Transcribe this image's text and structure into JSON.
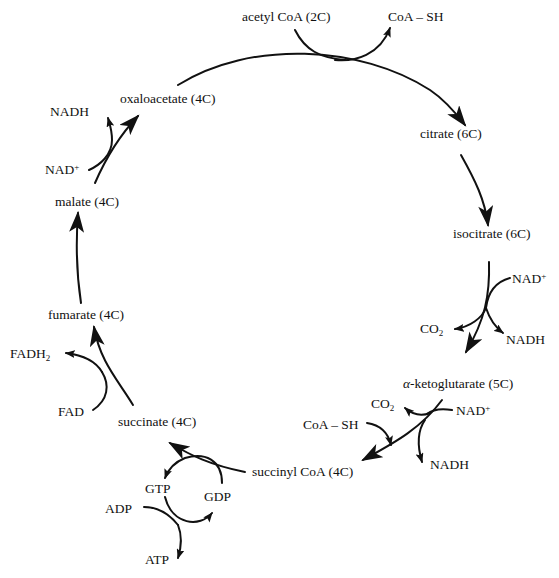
{
  "diagram": {
    "metabolites": [
      {
        "id": "acetyl_coa",
        "label": "acetyl CoA (2C)"
      },
      {
        "id": "citrate",
        "label": "citrate (6C)"
      },
      {
        "id": "isocitrate",
        "label": "isocitrate (6C)"
      },
      {
        "id": "alpha_kg_prefix",
        "label": "α"
      },
      {
        "id": "alpha_kg",
        "label": "-ketoglutarate (5C)"
      },
      {
        "id": "succinyl_coa",
        "label": "succinyl CoA (4C)"
      },
      {
        "id": "succinate",
        "label": "succinate (4C)"
      },
      {
        "id": "fumarate",
        "label": "fumarate (4C)"
      },
      {
        "id": "malate",
        "label": "malate (4C)"
      },
      {
        "id": "oxaloacetate",
        "label": "oxaloacetate (4C)"
      }
    ],
    "cofactors": {
      "coa_sh_top": "CoA – SH",
      "nad_isocitrate": "NAD",
      "nadh_isocitrate": "NADH",
      "co2_isocitrate": "CO",
      "co2_akg": "CO",
      "nad_akg": "NAD",
      "nadh_akg": "NADH",
      "coa_sh_akg": "CoA – SH",
      "gtp": "GTP",
      "gdp": "GDP",
      "adp": "ADP",
      "atp": "ATP",
      "fad": "FAD",
      "fadh2": "FADH",
      "nad_malate": "NAD",
      "nadh_malate": "NADH",
      "plus": "+",
      "sub2": "2"
    },
    "steps": [
      {
        "from": "oxaloacetate + acetyl CoA",
        "to": "citrate",
        "releases": "CoA – SH"
      },
      {
        "from": "citrate",
        "to": "isocitrate"
      },
      {
        "from": "isocitrate",
        "to": "α-ketoglutarate",
        "inputs": [
          "NAD+"
        ],
        "outputs": [
          "CO2",
          "NADH"
        ]
      },
      {
        "from": "α-ketoglutarate",
        "to": "succinyl CoA",
        "inputs": [
          "NAD+",
          "CoA – SH"
        ],
        "outputs": [
          "CO2",
          "NADH"
        ]
      },
      {
        "from": "succinyl CoA",
        "to": "succinate",
        "inputs": [
          "GDP"
        ],
        "outputs": [
          "GTP"
        ],
        "coupled": "ADP → ATP"
      },
      {
        "from": "succinate",
        "to": "fumarate",
        "inputs": [
          "FAD"
        ],
        "outputs": [
          "FADH2"
        ]
      },
      {
        "from": "fumarate",
        "to": "malate"
      },
      {
        "from": "malate",
        "to": "oxaloacetate",
        "inputs": [
          "NAD+"
        ],
        "outputs": [
          "NADH"
        ]
      }
    ]
  }
}
